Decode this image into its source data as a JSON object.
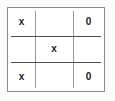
{
  "diagram": {
    "type": "tic-tac-toe-grid",
    "rows": 3,
    "columns": 3,
    "colors": {
      "background": "#fbfbf9",
      "board_background": "#ffffff",
      "frame_border": "#8a8a8a",
      "vertical_divider": "#9a9a9a",
      "horizontal_divider": "#4f4f4f",
      "mark_color": "#1c1c1c"
    },
    "cells": [
      {
        "id": "r1c1",
        "row": 1,
        "column": 1,
        "mark": "x",
        "label": "x"
      },
      {
        "id": "r1c2",
        "row": 1,
        "column": 2,
        "mark": "",
        "label": ""
      },
      {
        "id": "r1c3",
        "row": 1,
        "column": 3,
        "mark": "0",
        "label": "0"
      },
      {
        "id": "r2c1",
        "row": 2,
        "column": 1,
        "mark": "",
        "label": ""
      },
      {
        "id": "r2c2",
        "row": 2,
        "column": 2,
        "mark": "x",
        "label": "x"
      },
      {
        "id": "r2c3",
        "row": 2,
        "column": 3,
        "mark": "",
        "label": ""
      },
      {
        "id": "r3c1",
        "row": 3,
        "column": 1,
        "mark": "x",
        "label": "x"
      },
      {
        "id": "r3c2",
        "row": 3,
        "column": 2,
        "mark": "",
        "label": ""
      },
      {
        "id": "r3c3",
        "row": 3,
        "column": 3,
        "mark": "0",
        "label": "0"
      }
    ]
  }
}
